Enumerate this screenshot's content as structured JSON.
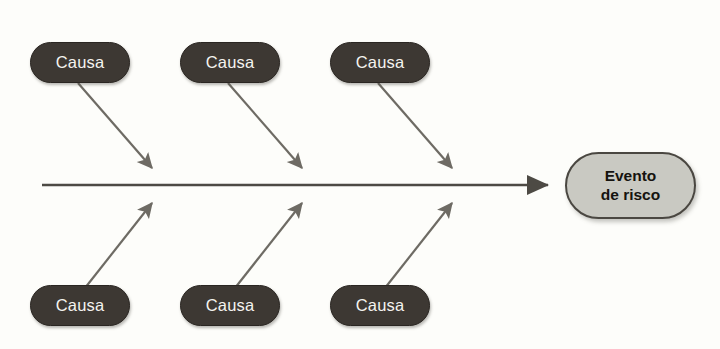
{
  "diagram": {
    "type": "fishbone-ishikawa",
    "title": "",
    "background_color": "#fdfdfa",
    "cause_box_color": "#3d3833",
    "cause_text_color": "#f4f3ef",
    "effect_box_color": "#c9c9c2",
    "effect_border_color": "#4a4741",
    "effect_text_color": "#15130f",
    "arrow_color": "#6e6b64",
    "spine_color": "#4d4a44",
    "causes": [
      {
        "id": "cause-top-1",
        "label": "Causa",
        "x": 30,
        "y": 42,
        "position": "top"
      },
      {
        "id": "cause-top-2",
        "label": "Causa",
        "x": 180,
        "y": 42,
        "position": "top"
      },
      {
        "id": "cause-top-3",
        "label": "Causa",
        "x": 330,
        "y": 42,
        "position": "top"
      },
      {
        "id": "cause-bottom-1",
        "label": "Causa",
        "x": 30,
        "y": 285,
        "position": "bottom"
      },
      {
        "id": "cause-bottom-2",
        "label": "Causa",
        "x": 180,
        "y": 285,
        "position": "bottom"
      },
      {
        "id": "cause-bottom-3",
        "label": "Causa",
        "x": 330,
        "y": 285,
        "position": "bottom"
      }
    ],
    "effect": {
      "id": "effect-node",
      "line1": "Evento",
      "line2": "de risco"
    },
    "spine": {
      "x1": 42,
      "y1": 185,
      "x2": 556,
      "y2": 185
    },
    "branches": [
      {
        "id": "branch-top-1",
        "x1": 78,
        "y1": 83,
        "x2": 157,
        "y2": 174
      },
      {
        "id": "branch-top-2",
        "x1": 228,
        "y1": 83,
        "x2": 307,
        "y2": 174
      },
      {
        "id": "branch-top-3",
        "x1": 378,
        "y1": 83,
        "x2": 457,
        "y2": 174
      },
      {
        "id": "branch-bottom-1",
        "x1": 85,
        "y1": 288,
        "x2": 157,
        "y2": 197
      },
      {
        "id": "branch-bottom-2",
        "x1": 235,
        "y1": 288,
        "x2": 307,
        "y2": 197
      },
      {
        "id": "branch-bottom-3",
        "x1": 385,
        "y1": 288,
        "x2": 457,
        "y2": 197
      }
    ]
  }
}
